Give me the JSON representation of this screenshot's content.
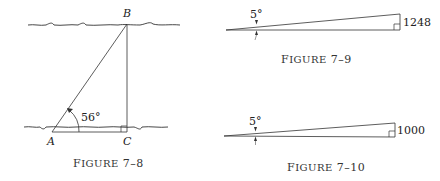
{
  "figures": [
    {
      "id": "7-8",
      "caption_prefix": "F",
      "caption_small": "IGURE",
      "caption_number": "7–8",
      "points": {
        "A": "A",
        "B": "B",
        "C": "C"
      },
      "angle_label": "56°"
    },
    {
      "id": "7-9",
      "caption_prefix": "F",
      "caption_small": "IGURE",
      "caption_number": "7–9",
      "angle_label": "5°",
      "side_label": "1248"
    },
    {
      "id": "7-10",
      "caption_prefix": "F",
      "caption_small": "IGURE",
      "caption_number": "7–10",
      "angle_label": "5°",
      "side_label": "1000"
    }
  ]
}
